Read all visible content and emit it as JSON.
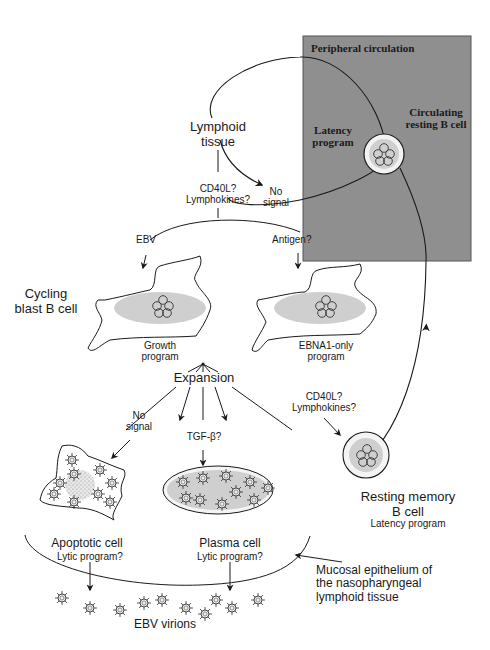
{
  "peripheral": {
    "title": "Peripheral circulation",
    "latency": "Latency program",
    "circulating_cell": "Circulating resting B cell",
    "box_color": "#8f8f8f"
  },
  "lymphoid": {
    "title_line1": "Lymphoid",
    "title_line2": "tissue",
    "signal_line1": "CD40L?",
    "signal_line2": "Lymphokines?",
    "no_signal_line1": "No",
    "no_signal_line2": "signal"
  },
  "branches": {
    "ebv": "EBV",
    "antigen": "Antigen?"
  },
  "blast": {
    "label_line1": "Cycling",
    "label_line2": "blast B cell",
    "growth_line1": "Growth",
    "growth_line2": "program",
    "ebna_line1": "EBNA1-only",
    "ebna_line2": "program"
  },
  "expansion": {
    "label": "Expansion",
    "no_signal_line1": "No",
    "no_signal_line2": "signal",
    "tgf": "TGF-β?",
    "cd40_line1": "CD40L?",
    "cd40_line2": "Lymphokines?"
  },
  "fates": {
    "apoptotic": "Apoptotic cell",
    "apoptotic_sub": "Lytic program?",
    "plasma": "Plasma cell",
    "plasma_sub": "Lytic program?",
    "memory_line1": "Resting memory",
    "memory_line2": "B cell",
    "memory_sub": "Latency program"
  },
  "epithelium": {
    "line1": "Mucosal epithelium of",
    "line2": "the nasopharyngeal",
    "line3": "lymphoid tissue"
  },
  "virions": {
    "label": "EBV virions"
  },
  "colors": {
    "nucleus": "#d0d0d0",
    "stroke": "#1a1a1a"
  }
}
